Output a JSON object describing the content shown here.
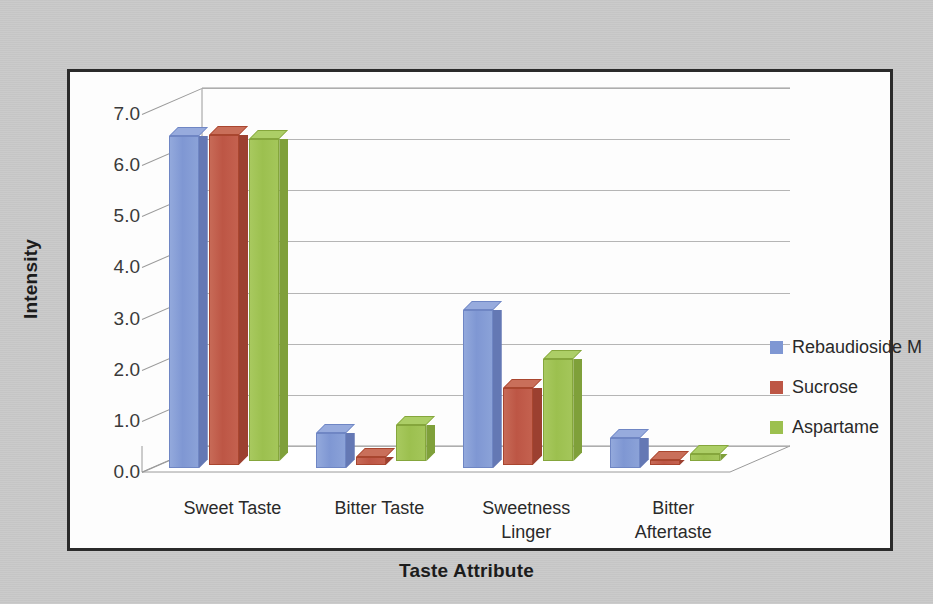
{
  "chart_data": {
    "type": "bar",
    "title": "",
    "xlabel": "Taste Attribute",
    "ylabel": "Intensity",
    "categories": [
      "Sweet Taste",
      "Bitter Taste",
      "Sweetness\nLinger",
      "Bitter\nAftertaste"
    ],
    "series": [
      {
        "name": "Rebaudioside M",
        "color": "#7f97d3",
        "values": [
          6.5,
          0.7,
          3.1,
          0.6
        ]
      },
      {
        "name": "Sucrose",
        "color": "#bd5645",
        "values": [
          6.45,
          0.15,
          1.5,
          0.1
        ]
      },
      {
        "name": "Aspartame",
        "color": "#9cc04f",
        "values": [
          6.3,
          0.7,
          2.0,
          0.15
        ]
      }
    ],
    "ylim": [
      0.0,
      7.0
    ],
    "ytick_labels": [
      "7.0",
      "6.0",
      "5.0",
      "4.0",
      "3.0",
      "2.0",
      "1.0",
      "0.0"
    ],
    "ytick_values": [
      7.0,
      6.0,
      5.0,
      4.0,
      3.0,
      2.0,
      1.0,
      0.0
    ],
    "grid": true,
    "legend_position": "right",
    "style": "3d-clustered-column"
  },
  "axis": {
    "x_title": "Taste Attribute",
    "y_title": "Intensity"
  },
  "colors": {
    "series_1": "#7f97d3",
    "series_2": "#bd5645",
    "series_3": "#9cc04f",
    "background": "#c9c9c9",
    "plot_background": "#fdfdfd",
    "border": "#2b2b2b",
    "gridline": "#9a9a9a"
  }
}
